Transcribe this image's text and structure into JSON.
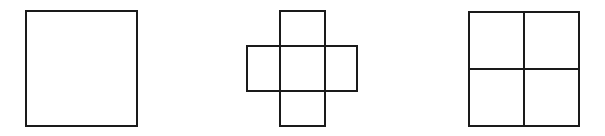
{
  "figure": {
    "width": 605,
    "height": 136,
    "background": "#ffffff",
    "stroke_color": "#1a1a1a",
    "stroke_width": 2
  },
  "shapes": [
    {
      "name": "square",
      "rects": [
        {
          "x": 26,
          "y": 11,
          "w": 111,
          "h": 115
        }
      ]
    },
    {
      "name": "cross",
      "rects": [
        {
          "x": 280,
          "y": 11,
          "w": 45,
          "h": 115
        },
        {
          "x": 247,
          "y": 46,
          "w": 110,
          "h": 45
        }
      ]
    },
    {
      "name": "quartered-square",
      "rects": [
        {
          "x": 469,
          "y": 12,
          "w": 110,
          "h": 114
        }
      ],
      "lines": [
        {
          "x1": 524,
          "y1": 12,
          "x2": 524,
          "y2": 126
        },
        {
          "x1": 469,
          "y1": 69,
          "x2": 579,
          "y2": 69
        }
      ]
    }
  ]
}
